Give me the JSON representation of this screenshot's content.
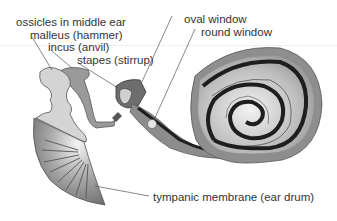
{
  "diagram": {
    "labels": {
      "ossicles": "ossicles in middle ear",
      "malleus": "malleus (hammer)",
      "incus": "incus (anvil)",
      "stapes": "stapes (stirrup)",
      "oval_window": "oval window",
      "round_window": "round window",
      "tympanic": "tympanic membrane (ear drum)"
    },
    "colors": {
      "text": "#333333",
      "leader": "#555555",
      "bone_light": "#d2d2d2",
      "bone_mid": "#9a9a9a",
      "bone_dark": "#6e6e6e",
      "cochlea_outer": "#8c8c8c",
      "cochlea_inner": "#c8c8c8",
      "cochlea_stripe": "#1e1e1e"
    }
  }
}
